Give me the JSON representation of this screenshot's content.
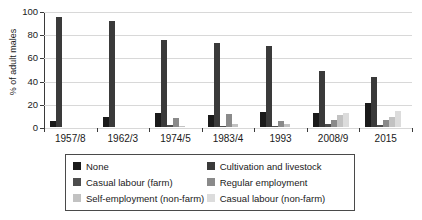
{
  "chart_data": {
    "type": "bar",
    "title": "",
    "xlabel": "",
    "ylabel": "% of adult males",
    "ylim": [
      0,
      100
    ],
    "yticks": [
      0,
      20,
      40,
      60,
      80,
      100
    ],
    "grid": true,
    "legend_position": "bottom",
    "categories": [
      "1957/8",
      "1962/3",
      "1974/5",
      "1983/4",
      "1993",
      "2008/9",
      "2015"
    ],
    "series": [
      {
        "name": "None",
        "color": "#1a1a1a",
        "values": [
          5,
          9,
          12,
          10,
          13,
          12,
          21
        ]
      },
      {
        "name": "Cultivation and livestock",
        "color": "#3a3a3a",
        "values": [
          95,
          91,
          75,
          72,
          70,
          48,
          43
        ]
      },
      {
        "name": "Casual labour (farm)",
        "color": "#4d4d4d",
        "values": [
          0,
          0,
          2,
          1,
          1,
          3,
          2
        ]
      },
      {
        "name": "Regular employment",
        "color": "#8a8a8a",
        "values": [
          0,
          0,
          8,
          11,
          5,
          6,
          6
        ]
      },
      {
        "name": "Self-employment (non-farm)",
        "color": "#c2c2c2",
        "values": [
          0,
          0,
          1,
          3,
          3,
          10,
          9
        ]
      },
      {
        "name": "Casual labour (non-farm)",
        "color": "#dcdcdc",
        "values": [
          0,
          0,
          0,
          0,
          0,
          12,
          14
        ]
      }
    ]
  },
  "legend": {
    "items": [
      {
        "label": "None",
        "color": "#1a1a1a"
      },
      {
        "label": "Cultivation and livestock",
        "color": "#3a3a3a"
      },
      {
        "label": "Casual labour (farm)",
        "color": "#4d4d4d"
      },
      {
        "label": "Regular employment",
        "color": "#8a8a8a"
      },
      {
        "label": "Self-employment (non-farm)",
        "color": "#c2c2c2"
      },
      {
        "label": "Casual labour (non-farm)",
        "color": "#dcdcdc"
      }
    ]
  }
}
